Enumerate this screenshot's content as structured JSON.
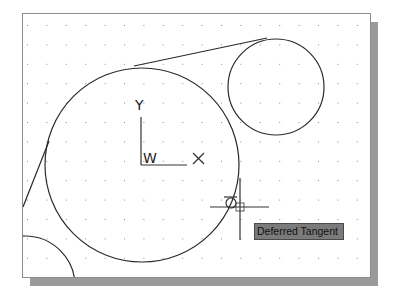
{
  "drawing": {
    "grid": {
      "origin_x": 4,
      "origin_y": 11,
      "spacing": 19.4,
      "cols": 18,
      "rows": 14,
      "dot_color": "#8a8a8a"
    },
    "entities": {
      "large_circle": {
        "cx": 119,
        "cy": 151,
        "r": 97
      },
      "small_circle": {
        "cx": 253,
        "cy": 73,
        "r": 48
      },
      "corner_arc": {
        "cx": 2,
        "cy": 272,
        "r": 50
      },
      "tangent_line_top": {
        "x1": 111,
        "y1": 52,
        "x2": 244,
        "y2": 24
      },
      "tangent_line_left": {
        "x1": 0,
        "y1": 193,
        "x2": 26,
        "y2": 127
      }
    },
    "line_color": "#2a2a2a"
  },
  "ucs_icon": {
    "y_label": "Y",
    "x_label": "X",
    "w_label": "W"
  },
  "cursor": {
    "x": 217,
    "y": 193
  },
  "osnap_tooltip": {
    "label": "Deferred Tangent",
    "background": "#7b7b7b"
  }
}
